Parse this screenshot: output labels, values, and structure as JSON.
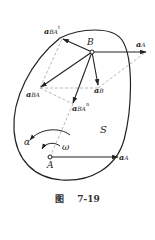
{
  "figure": {
    "caption_prefix": "图",
    "caption_number": "7-19",
    "region_label": "S",
    "points": {
      "A": {
        "label": "A",
        "x": 50,
        "y": 157
      },
      "B": {
        "label": "B",
        "x": 92,
        "y": 52
      }
    },
    "vectors": [
      {
        "name": "a_A at A",
        "label": "a",
        "subscript": "A",
        "from": [
          50,
          157
        ],
        "to": [
          118,
          157
        ]
      },
      {
        "name": "a_A at B",
        "label": "a",
        "subscript": "A",
        "from": [
          92,
          52
        ],
        "to": [
          146,
          52
        ]
      },
      {
        "name": "a_B",
        "label": "a",
        "subscript": "B",
        "from": [
          92,
          52
        ],
        "to": [
          98,
          85
        ]
      },
      {
        "name": "a_BA",
        "label": "a",
        "subscript": "BA",
        "from": [
          92,
          52
        ],
        "to": [
          40,
          88
        ]
      },
      {
        "name": "a_BA^t",
        "label": "a",
        "subscript": "BA",
        "superscript": "t",
        "from": [
          92,
          52
        ],
        "to": [
          62,
          39
        ]
      },
      {
        "name": "a_BA^n",
        "label": "a",
        "subscript": "BA",
        "superscript": "n",
        "from": [
          92,
          52
        ],
        "to": [
          73,
          104
        ]
      }
    ],
    "angular": {
      "alpha": "α",
      "omega": "ω"
    },
    "colors": {
      "stroke": "#222222",
      "dashed": "#888888"
    }
  }
}
